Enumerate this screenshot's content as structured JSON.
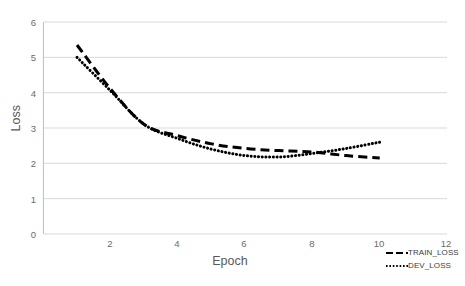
{
  "chart_data": {
    "type": "line",
    "title": "",
    "xlabel": "Epoch",
    "ylabel": "Loss",
    "xlim": [
      0,
      12
    ],
    "ylim": [
      0,
      6
    ],
    "xticks": [
      2,
      4,
      6,
      8,
      10,
      12
    ],
    "yticks": [
      0,
      1,
      2,
      3,
      4,
      5,
      6
    ],
    "grid": "horizontal",
    "legend_position": "bottom-right",
    "x": [
      1,
      2,
      3,
      4,
      5,
      6,
      7,
      8,
      9,
      10
    ],
    "series": [
      {
        "name": "TRAIN_LOSS",
        "style": "dashed",
        "color": "#000000",
        "values": [
          5.35,
          4.1,
          3.1,
          2.78,
          2.55,
          2.42,
          2.36,
          2.32,
          2.22,
          2.15
        ]
      },
      {
        "name": "DEV_LOSS",
        "style": "dotted",
        "color": "#000000",
        "values": [
          5.0,
          4.05,
          3.1,
          2.7,
          2.4,
          2.22,
          2.18,
          2.28,
          2.42,
          2.6
        ]
      }
    ]
  },
  "axes": {
    "y_tick_labels": [
      "6",
      "5",
      "4",
      "3",
      "2",
      "1",
      "0"
    ],
    "x_tick_labels": [
      "2",
      "4",
      "6",
      "8",
      "10",
      "12"
    ],
    "ylabel": "Loss",
    "xlabel": "Epoch"
  },
  "legend": {
    "items": [
      {
        "label": "TRAIN_LOSS",
        "style": "dashed"
      },
      {
        "label": "DEV_LOSS",
        "style": "dotted"
      }
    ]
  },
  "colors": {
    "series": "#000000",
    "gridline": "#d9d9d9",
    "axis": "#bfbfbf",
    "tick_text": "#6b6b6b",
    "title_text": "#595959",
    "background": "#ffffff"
  }
}
